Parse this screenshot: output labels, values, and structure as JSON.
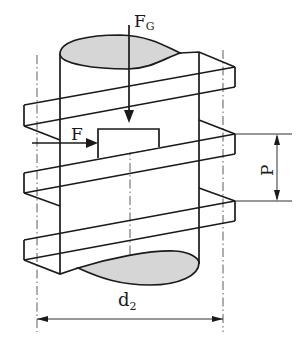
{
  "diagram": {
    "type": "screw-thread-helix",
    "labels": {
      "axial_force": "F",
      "axial_force_sub": "G",
      "tangential_force": "F",
      "pitch": "P",
      "pitch_diameter": "d",
      "pitch_diameter_sub": "2"
    },
    "colors": {
      "line": "#1a1a1a",
      "section_fill": "#d6d6d6",
      "background": "#ffffff"
    }
  }
}
